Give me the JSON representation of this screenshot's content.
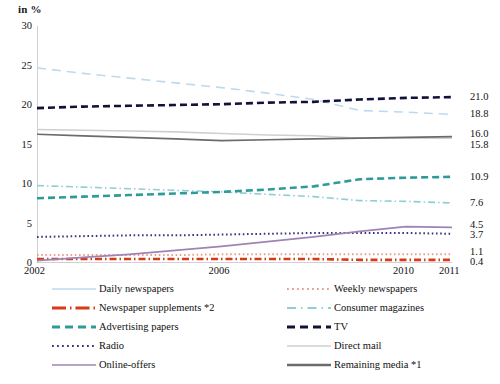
{
  "axis_title": "in %",
  "x_axis": {
    "ticks": [
      "2002",
      "2006",
      "2010",
      "2011"
    ],
    "tick_years": [
      2002,
      2006,
      2010,
      2011
    ],
    "range": [
      2002,
      2011
    ]
  },
  "y_axis": {
    "ticks": [
      "0",
      "5",
      "10",
      "15",
      "20",
      "25",
      "30"
    ],
    "tick_values": [
      0,
      5,
      10,
      15,
      20,
      25,
      30
    ],
    "range": [
      0,
      30
    ]
  },
  "end_labels": [
    {
      "value": "21.0",
      "series": "TV"
    },
    {
      "value": "18.8",
      "series": "Daily newspapers"
    },
    {
      "value": "16.0",
      "series": "Remaining media *1"
    },
    {
      "value": "15.8",
      "series": "Direct mail"
    },
    {
      "value": "10.9",
      "series": "Advertising papers"
    },
    {
      "value": "7.6",
      "series": "Consumer magazines"
    },
    {
      "value": "4.5",
      "series": "Online-offers"
    },
    {
      "value": "3.7",
      "series": "Radio"
    },
    {
      "value": "1.1",
      "series": "Weekly newspapers"
    },
    {
      "value": "0.4",
      "series": "Newspaper supplements *2"
    }
  ],
  "legend": {
    "left_column": [
      {
        "label": "Daily newspapers",
        "color": "#bcd9ef",
        "style": "solid-thin"
      },
      {
        "label": "Newspaper supplements *2",
        "color": "#d93a16",
        "style": "dashdot-thick"
      },
      {
        "label": "Advertising papers",
        "color": "#2e9b98",
        "style": "dashed-thick"
      },
      {
        "label": "Radio",
        "color": "#3b3580",
        "style": "dotted"
      },
      {
        "label": "Online-offers",
        "color": "#a083b5",
        "style": "solid"
      }
    ],
    "right_column": [
      {
        "label": "Weekly newspapers",
        "color": "#e8a090",
        "style": "dotted"
      },
      {
        "label": "Consumer magazines",
        "color": "#8ecfd6",
        "style": "dashdot"
      },
      {
        "label": "TV",
        "color": "#11113a",
        "style": "dashed-thick"
      },
      {
        "label": "Direct mail",
        "color": "#cfcfcf",
        "style": "solid-thin"
      },
      {
        "label": "Remaining media *1",
        "color": "#6b6b6b",
        "style": "solid-thick"
      }
    ]
  },
  "chart_data": {
    "type": "line",
    "title": "",
    "subtitle": "",
    "xlabel": "",
    "ylabel": "in %",
    "xlim": [
      2002,
      2011
    ],
    "ylim": [
      0,
      30
    ],
    "grid": false,
    "legend_position": "bottom",
    "x": [
      2002,
      2003,
      2004,
      2005,
      2006,
      2007,
      2008,
      2009,
      2010,
      2011
    ],
    "series": [
      {
        "name": "Daily newspapers",
        "color": "#bcd9ef",
        "style": "dashed",
        "end_value": 18.8,
        "values": [
          24.7,
          24.0,
          23.4,
          22.8,
          22.2,
          21.5,
          20.7,
          19.3,
          19.1,
          18.8
        ]
      },
      {
        "name": "Weekly newspapers",
        "color": "#e8a090",
        "style": "dotted",
        "end_value": 1.1,
        "values": [
          1.0,
          1.0,
          1.0,
          1.0,
          1.1,
          1.1,
          1.1,
          1.1,
          1.1,
          1.1
        ]
      },
      {
        "name": "Newspaper supplements *2",
        "color": "#d93a16",
        "style": "dashdot",
        "end_value": 0.4,
        "values": [
          0.5,
          0.5,
          0.5,
          0.5,
          0.5,
          0.5,
          0.5,
          0.4,
          0.4,
          0.4
        ]
      },
      {
        "name": "Consumer magazines",
        "color": "#8ecfd6",
        "style": "dashdot",
        "end_value": 7.6,
        "values": [
          9.8,
          9.6,
          9.4,
          9.2,
          9.0,
          8.7,
          8.4,
          7.9,
          7.8,
          7.6
        ]
      },
      {
        "name": "Advertising papers",
        "color": "#2e9b98",
        "style": "dashed",
        "end_value": 10.9,
        "values": [
          8.2,
          8.4,
          8.6,
          8.8,
          9.0,
          9.3,
          9.7,
          10.6,
          10.8,
          10.9
        ]
      },
      {
        "name": "TV",
        "color": "#11113a",
        "style": "dashed",
        "end_value": 21.0,
        "values": [
          19.6,
          19.8,
          19.9,
          20.0,
          20.1,
          20.3,
          20.4,
          20.7,
          20.9,
          21.0
        ]
      },
      {
        "name": "Radio",
        "color": "#3b3580",
        "style": "dotted",
        "end_value": 3.7,
        "values": [
          3.3,
          3.4,
          3.5,
          3.5,
          3.6,
          3.7,
          3.8,
          3.8,
          3.8,
          3.7
        ]
      },
      {
        "name": "Direct mail",
        "color": "#cfcfcf",
        "style": "solid",
        "end_value": 15.8,
        "values": [
          16.9,
          16.8,
          16.7,
          16.6,
          16.4,
          16.2,
          16.1,
          15.8,
          15.8,
          15.8
        ]
      },
      {
        "name": "Online-offers",
        "color": "#a083b5",
        "style": "solid",
        "end_value": 4.5,
        "values": [
          0.3,
          0.7,
          1.1,
          1.6,
          2.1,
          2.7,
          3.3,
          4.0,
          4.6,
          4.5
        ]
      },
      {
        "name": "Remaining media *1",
        "color": "#6b6b6b",
        "style": "solid",
        "end_value": 16.0,
        "values": [
          16.3,
          16.1,
          15.9,
          15.7,
          15.5,
          15.6,
          15.7,
          15.8,
          15.9,
          16.0
        ]
      }
    ]
  }
}
